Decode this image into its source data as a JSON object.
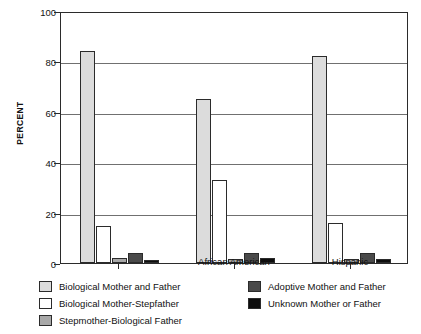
{
  "chart_data": {
    "type": "bar",
    "title": "",
    "xlabel": "",
    "ylabel": "PERCENT",
    "ylim": [
      0,
      100
    ],
    "yticks": [
      0,
      20,
      40,
      60,
      80,
      100
    ],
    "ytick_labels": [
      "0",
      "20",
      "40",
      "60",
      "80",
      "100"
    ],
    "grid": true,
    "legend_position": "below",
    "categories": [
      "",
      "African American",
      "Hispanic"
    ],
    "series": [
      {
        "name": "Biological Mother and Father",
        "color": "#dcdcdc",
        "values": [
          84,
          65,
          82
        ]
      },
      {
        "name": "Biological Mother-Stepfather",
        "color": "#ffffff",
        "values": [
          14.5,
          33,
          16
        ]
      },
      {
        "name": "Stepmother-Biological Father",
        "color": "#a8a8a8",
        "values": [
          2,
          1.5,
          1.5
        ]
      },
      {
        "name": "Adoptive Mother and Father",
        "color": "#4a4a4a",
        "values": [
          4,
          4,
          4
        ]
      },
      {
        "name": "Unknown Mother or Father",
        "color": "#0d0d0d",
        "values": [
          1,
          2,
          1.5
        ]
      }
    ]
  },
  "legend": {
    "left_column": [
      {
        "label": "Biological Mother and Father",
        "color": "#dcdcdc"
      },
      {
        "label": "Biological Mother-Stepfather",
        "color": "#ffffff"
      },
      {
        "label": "Stepmother-Biological Father",
        "color": "#a8a8a8"
      }
    ],
    "right_column": [
      {
        "label": "Adoptive Mother and Father",
        "color": "#4a4a4a"
      },
      {
        "label": "Unknown Mother or Father",
        "color": "#0d0d0d"
      }
    ]
  }
}
